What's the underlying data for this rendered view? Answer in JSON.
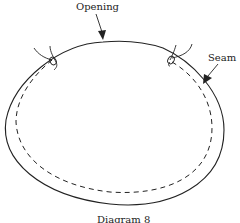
{
  "diagram": {
    "labels": {
      "opening": "Opening",
      "seam": "Seam"
    },
    "caption": "Diagram 8",
    "colors": {
      "stroke": "#222222",
      "background": "#ffffff"
    },
    "elements": [
      {
        "name": "outer-edge",
        "style": "solid",
        "shape": "open oval"
      },
      {
        "name": "seam-line",
        "style": "dashed",
        "shape": "inner oval"
      },
      {
        "name": "thread-tie-left",
        "style": "solid"
      },
      {
        "name": "thread-tie-right",
        "style": "solid"
      },
      {
        "name": "opening-arrow",
        "target": "top gap between ties"
      },
      {
        "name": "seam-arrow",
        "target": "right seam"
      }
    ]
  }
}
